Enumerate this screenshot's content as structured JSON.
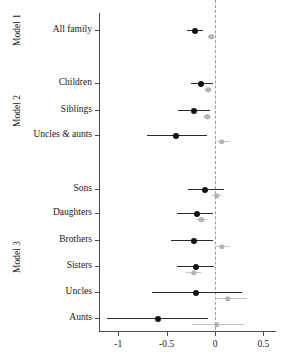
{
  "figure": {
    "type": "forest-plot",
    "xaxis": {
      "label": "",
      "ticks": [
        "-1",
        "-0.5",
        "0",
        "0.5"
      ],
      "tick_values": [
        -1,
        -0.5,
        0,
        0.5
      ],
      "range": [
        -1.2,
        0.62
      ]
    },
    "reference_line": 0,
    "groups": [
      {
        "name": "Model 1",
        "label": "Model 1"
      },
      {
        "name": "Model 2",
        "label": "Model 2"
      },
      {
        "name": "Model 3",
        "label": "Model 3"
      }
    ],
    "series": [
      {
        "name": "primary",
        "color": "#111111"
      },
      {
        "name": "secondary",
        "color": "#b4b4b4"
      }
    ]
  },
  "chart_data": {
    "type": "scatter",
    "title": "",
    "xlabel": "",
    "ylabel": "",
    "xlim": [
      -1.2,
      0.62
    ],
    "grid": false,
    "legend": "none",
    "reference_line": 0,
    "xticks": [
      -1,
      -0.5,
      0,
      0.5
    ],
    "xticklabels": [
      "-1",
      "-0.5",
      "0",
      "0.5"
    ],
    "groups": [
      "Model 1",
      "Model 2",
      "Model 3"
    ],
    "categories": [
      "All family",
      "Children",
      "Siblings",
      "Uncles & aunts",
      "Sons",
      "Daughters",
      "Brothers",
      "Sisters",
      "Uncles",
      "Aunts"
    ],
    "series": [
      {
        "name": "primary",
        "color": "#111111",
        "estimates": [
          -0.21,
          -0.14,
          -0.22,
          -0.4,
          -0.1,
          -0.19,
          -0.22,
          -0.2,
          -0.2,
          -0.59
        ],
        "ci_low": [
          -0.29,
          -0.25,
          -0.38,
          -0.7,
          -0.28,
          -0.39,
          -0.46,
          -0.39,
          -0.65,
          -1.12
        ],
        "ci_high": [
          -0.12,
          -0.02,
          -0.05,
          -0.08,
          0.09,
          -0.02,
          -0.02,
          -0.01,
          0.28,
          -0.07
        ]
      },
      {
        "name": "secondary",
        "color": "#b4b4b4",
        "estimates": [
          -0.04,
          -0.07,
          -0.08,
          0.07,
          0.02,
          -0.14,
          0.07,
          -0.22,
          0.13,
          0.02
        ],
        "ci_low": [
          -0.07,
          -0.11,
          -0.12,
          0.02,
          -0.03,
          -0.2,
          0.0,
          -0.3,
          0.0,
          -0.24
        ],
        "ci_high": [
          -0.01,
          -0.03,
          -0.04,
          0.15,
          0.06,
          -0.08,
          0.16,
          -0.14,
          0.33,
          0.3
        ]
      }
    ],
    "rows": [
      {
        "group": "Model 1",
        "category": "All family",
        "primary": {
          "est": -0.21,
          "lo": -0.29,
          "hi": -0.12
        },
        "secondary": {
          "est": -0.04,
          "lo": -0.07,
          "hi": -0.01
        }
      },
      {
        "group": "Model 2",
        "category": "Children",
        "primary": {
          "est": -0.14,
          "lo": -0.25,
          "hi": -0.02
        },
        "secondary": {
          "est": -0.07,
          "lo": -0.11,
          "hi": -0.03
        }
      },
      {
        "group": "Model 2",
        "category": "Siblings",
        "primary": {
          "est": -0.22,
          "lo": -0.38,
          "hi": -0.05
        },
        "secondary": {
          "est": -0.08,
          "lo": -0.12,
          "hi": -0.04
        }
      },
      {
        "group": "Model 2",
        "category": "Uncles & aunts",
        "primary": {
          "est": -0.4,
          "lo": -0.7,
          "hi": -0.08
        },
        "secondary": {
          "est": 0.07,
          "lo": 0.02,
          "hi": 0.15
        }
      },
      {
        "group": "Model 3",
        "category": "Sons",
        "primary": {
          "est": -0.1,
          "lo": -0.28,
          "hi": 0.09
        },
        "secondary": {
          "est": 0.02,
          "lo": -0.03,
          "hi": 0.06
        }
      },
      {
        "group": "Model 3",
        "category": "Daughters",
        "primary": {
          "est": -0.19,
          "lo": -0.39,
          "hi": -0.02
        },
        "secondary": {
          "est": -0.14,
          "lo": -0.2,
          "hi": -0.08
        }
      },
      {
        "group": "Model 3",
        "category": "Brothers",
        "primary": {
          "est": -0.22,
          "lo": -0.46,
          "hi": -0.02
        },
        "secondary": {
          "est": 0.07,
          "lo": 0.0,
          "hi": 0.16
        }
      },
      {
        "group": "Model 3",
        "category": "Sisters",
        "primary": {
          "est": -0.2,
          "lo": -0.39,
          "hi": -0.01
        },
        "secondary": {
          "est": -0.22,
          "lo": -0.3,
          "hi": -0.14
        }
      },
      {
        "group": "Model 3",
        "category": "Uncles",
        "primary": {
          "est": -0.2,
          "lo": -0.65,
          "hi": 0.28
        },
        "secondary": {
          "est": 0.13,
          "lo": 0.0,
          "hi": 0.33
        }
      },
      {
        "group": "Model 3",
        "category": "Aunts",
        "primary": {
          "est": -0.59,
          "lo": -1.12,
          "hi": -0.07
        },
        "secondary": {
          "est": 0.02,
          "lo": -0.24,
          "hi": 0.3
        }
      }
    ]
  },
  "layout": {
    "row_y": [
      30,
      83,
      110,
      135,
      189,
      213,
      240,
      266,
      292,
      318
    ],
    "group_y": [
      30,
      111,
      257
    ],
    "group_x": 18,
    "axis_left": 99,
    "axis_right": 276,
    "axis_top": 13,
    "axis_bottom": 331,
    "x0_px": 215,
    "px_per_unit": 96.7
  }
}
